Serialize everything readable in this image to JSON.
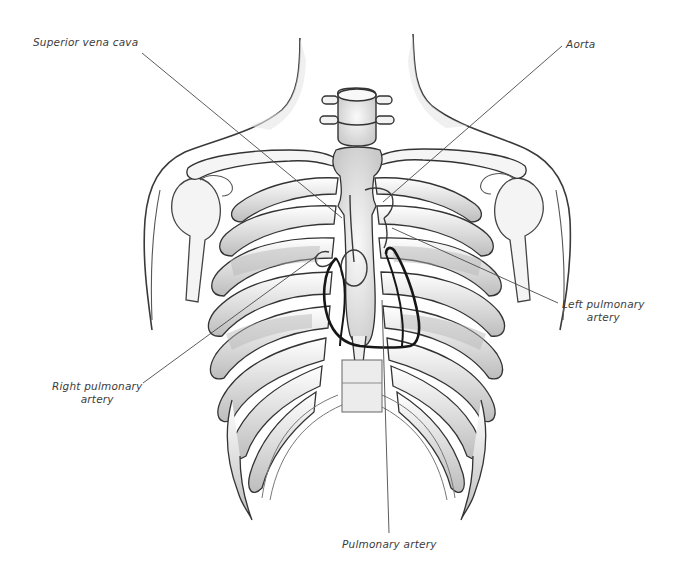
{
  "figure": {
    "style": "pencil illustration, greyscale",
    "colors": {
      "background": "#ffffff",
      "leader_line": "#4a4a4a",
      "heart_outline": "#1a1a1a",
      "bone_fill": "#f2f2f2",
      "bone_shadow": "#b8b8b8",
      "sketch_stroke": "#3a3a3a",
      "label_text": "#3c3c3c"
    }
  },
  "labels": [
    {
      "id": "superior-vena-cava",
      "text": "Superior vena cava",
      "lines": [
        "Superior vena cava"
      ],
      "x": 33,
      "y": 36,
      "align": "left",
      "leader": {
        "x1": 142,
        "y1": 53,
        "x2": 342,
        "y2": 218
      }
    },
    {
      "id": "aorta",
      "text": "Aorta",
      "lines": [
        "Aorta"
      ],
      "x": 566,
      "y": 38,
      "align": "left",
      "leader": {
        "x1": 562,
        "y1": 46,
        "x2": 383,
        "y2": 202
      }
    },
    {
      "id": "left-pulmonary-artery",
      "text": "Left pulmonary artery",
      "lines": [
        "Left pulmonary",
        "artery"
      ],
      "x": 562,
      "y": 298,
      "align": "center",
      "leader": {
        "x1": 392,
        "y1": 228,
        "x2": 558,
        "y2": 303
      }
    },
    {
      "id": "right-pulmonary-artery",
      "text": "Right pulmonary artery",
      "lines": [
        "Right pulmonary",
        "artery"
      ],
      "x": 52,
      "y": 380,
      "align": "center",
      "leader": {
        "x1": 318,
        "y1": 255,
        "x2": 143,
        "y2": 383
      }
    },
    {
      "id": "pulmonary-artery",
      "text": "Pulmonary artery",
      "lines": [
        "Pulmonary artery"
      ],
      "x": 342,
      "y": 538,
      "align": "left",
      "leader": {
        "x1": 382,
        "y1": 300,
        "x2": 389,
        "y2": 533
      }
    }
  ]
}
